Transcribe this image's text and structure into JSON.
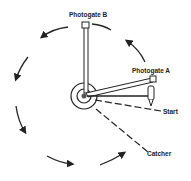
{
  "diagram": {
    "labels": {
      "photogate_b": "Photogate B",
      "photogate_a": "Photogate A",
      "start": "Start",
      "catcher": "Catcher"
    },
    "colors": {
      "stroke": "#222222",
      "fill": "#ffffff"
    }
  }
}
